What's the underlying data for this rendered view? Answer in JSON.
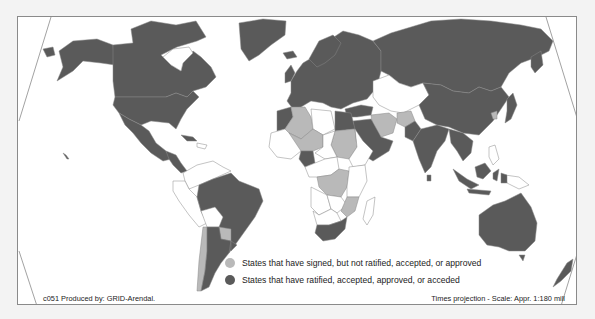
{
  "map": {
    "projection_note": "Times projection - Scale: Appr. 1:180 mill",
    "credit": "c051 Produced by: GRID-Arendal.",
    "colors": {
      "background": "#f3f3f3",
      "ocean": "#ffffff",
      "ratified": "#5a5a5a",
      "signed": "#b9b9b9",
      "none": "#ffffff",
      "border": "#8a8a8a"
    }
  },
  "legend": {
    "items": [
      {
        "label": "States that have signed, but not ratified, accepted, or approved",
        "color": "#b9b9b9"
      },
      {
        "label": "States that have ratified, accepted, approved, or acceded",
        "color": "#5a5a5a"
      }
    ]
  }
}
